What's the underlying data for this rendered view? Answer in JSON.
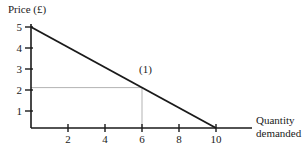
{
  "chart_data": {
    "type": "line",
    "title": "",
    "subtitle": "",
    "xlabel_line1": "Quantity",
    "xlabel_line2": "demanded",
    "xlabel": "Quantity demanded",
    "ylabel": "Price (£)",
    "xlim": [
      0,
      11.7
    ],
    "ylim": [
      0,
      5.4
    ],
    "xticks": [
      2,
      4,
      6,
      8,
      10
    ],
    "yticks": [
      1,
      2,
      3,
      4,
      5
    ],
    "xtick_labels": [
      "2",
      "4",
      "6",
      "8",
      "10"
    ],
    "ytick_labels": [
      "1",
      "2",
      "3",
      "4",
      "5"
    ],
    "grid": false,
    "legend": "none",
    "series": [
      {
        "name": "Demand",
        "x": [
          0,
          10
        ],
        "y": [
          5,
          0
        ],
        "color": "#1a1a1a"
      }
    ],
    "annotations": [
      {
        "label": "(1)",
        "x": 6,
        "y": 2,
        "guide_lines": true,
        "guide_color": "#b3b3b3"
      }
    ],
    "axis_color": "#1a1a1a",
    "background": "#ffffff"
  }
}
